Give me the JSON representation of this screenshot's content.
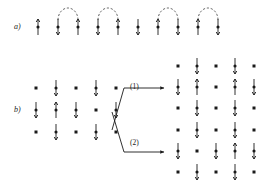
{
  "figure": {
    "title": "",
    "type": "spin-lattice-diagram",
    "panels": [
      {
        "id": "a",
        "label": "a)",
        "description": "One-dimensional chain of alternating spins with dashed arcs pairing neighbouring sites (singlet bonds)",
        "origin": {
          "x": 38,
          "y": 27
        },
        "site_spacing": 20,
        "sites": [
          {
            "index": 0,
            "x": 38,
            "spin": "up"
          },
          {
            "index": 1,
            "x": 58,
            "spin": "up"
          },
          {
            "index": 2,
            "x": 78,
            "spin": "up"
          },
          {
            "index": 3,
            "x": 98,
            "spin": "up"
          },
          {
            "index": 4,
            "x": 118,
            "spin": "up"
          },
          {
            "index": 5,
            "x": 138,
            "spin": "up"
          },
          {
            "index": 6,
            "x": 158,
            "spin": "up"
          },
          {
            "index": 7,
            "x": 178,
            "spin": "up"
          },
          {
            "index": 8,
            "x": 198,
            "spin": "up"
          },
          {
            "index": 9,
            "x": 218,
            "spin": "up"
          }
        ],
        "arcs": [
          {
            "from": 1,
            "to": 2
          },
          {
            "from": 3,
            "to": 4
          },
          {
            "from": 6,
            "to": 7
          },
          {
            "from": 8,
            "to": 9
          }
        ]
      },
      {
        "id": "b",
        "label": "b)",
        "description": "Two-dimensional lattice configuration transformed by two processes into two final configurations",
        "initial_grid": {
          "origin": {
            "x": 36,
            "y": 88
          },
          "col_spacing": 20,
          "row_spacing": 22,
          "cols": 5,
          "rows": 3,
          "cells": [
            [
              "dot",
              "spin",
              "dot",
              "spin",
              "dot"
            ],
            [
              "spin",
              "spin",
              "spin",
              "dot",
              "spin"
            ],
            [
              "dot",
              "spin",
              "dot",
              "spin",
              "dot"
            ]
          ]
        },
        "result_grid_1": {
          "origin": {
            "x": 178,
            "y": 66
          },
          "col_spacing": 19,
          "row_spacing": 21,
          "cols": 5,
          "rows": 3,
          "cells": [
            [
              "dot",
              "spin",
              "dot",
              "spin",
              "dot"
            ],
            [
              "spin",
              "spin",
              "dot",
              "spin",
              "spin"
            ],
            [
              "dot",
              "spin",
              "dot",
              "spin",
              "dot"
            ]
          ]
        },
        "result_grid_2": {
          "origin": {
            "x": 178,
            "y": 130
          },
          "col_spacing": 19,
          "row_spacing": 21,
          "cols": 5,
          "rows": 3,
          "cells": [
            [
              "dot",
              "spin",
              "dot",
              "spin",
              "dot"
            ],
            [
              "spin",
              "dot",
              "spin",
              "spin",
              "spin"
            ],
            [
              "dot",
              "spin",
              "dot",
              "spin",
              "dot"
            ]
          ]
        }
      }
    ],
    "transitions": [
      {
        "id": "1",
        "label": "(1)",
        "target": "result_grid_1"
      },
      {
        "id": "2",
        "label": "(2)",
        "target": "result_grid_2"
      }
    ],
    "colors": {
      "ink": "#1a1a1a",
      "arc": "#3a3a3a",
      "background": "#ffffff"
    }
  }
}
